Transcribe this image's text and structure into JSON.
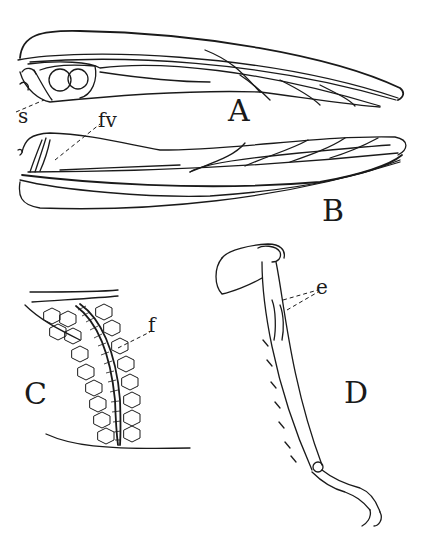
{
  "figure": {
    "panels": [
      {
        "id": "A",
        "label": "A",
        "subject": "fore wing (tegmen)"
      },
      {
        "id": "B",
        "label": "B",
        "subject": "fore wing, other side"
      },
      {
        "id": "C",
        "label": "C",
        "subject": "stridulatory file detail"
      },
      {
        "id": "D",
        "label": "D",
        "subject": "fore leg with tympanum"
      }
    ],
    "annotations": {
      "s": "s",
      "fv": "fv",
      "f": "f",
      "e": "e"
    },
    "colors": {
      "ink": "#1a1a1a",
      "paper": "#ffffff"
    }
  }
}
